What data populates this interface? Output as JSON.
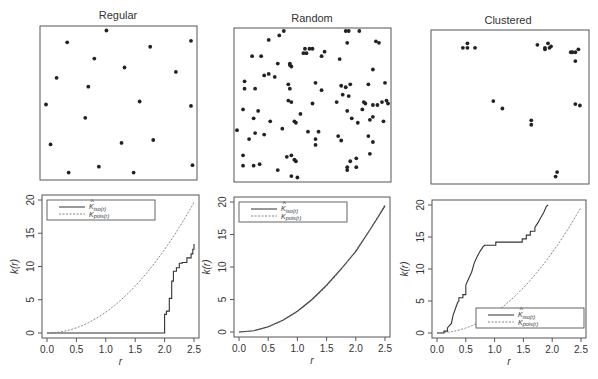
{
  "chart_data": [
    {
      "type": "scatter",
      "title": "Regular",
      "xlim": [
        0,
        1
      ],
      "ylim": [
        0,
        1
      ],
      "points": [
        [
          0.42,
          0.99
        ],
        [
          0.16,
          0.91
        ],
        [
          0.71,
          0.88
        ],
        [
          0.98,
          0.92
        ],
        [
          0.34,
          0.8
        ],
        [
          0.54,
          0.74
        ],
        [
          0.88,
          0.71
        ],
        [
          0.09,
          0.67
        ],
        [
          0.3,
          0.61
        ],
        [
          0.02,
          0.49
        ],
        [
          0.64,
          0.51
        ],
        [
          0.98,
          0.48
        ],
        [
          0.28,
          0.4
        ],
        [
          0.05,
          0.22
        ],
        [
          0.52,
          0.23
        ],
        [
          0.73,
          0.25
        ],
        [
          0.37,
          0.07
        ],
        [
          0.99,
          0.08
        ],
        [
          0.17,
          0.03
        ],
        [
          0.6,
          0.03
        ]
      ]
    },
    {
      "type": "scatter",
      "title": "Random",
      "xlim": [
        0,
        1
      ],
      "ylim": [
        0,
        1
      ],
      "points": [
        [
          0.21,
          0.94
        ],
        [
          0.28,
          0.97
        ],
        [
          0.31,
          1.0
        ],
        [
          0.45,
          0.88
        ],
        [
          0.48,
          0.88
        ],
        [
          0.5,
          0.88
        ],
        [
          0.46,
          0.85
        ],
        [
          0.44,
          0.85
        ],
        [
          0.58,
          0.86
        ],
        [
          0.72,
          1.0
        ],
        [
          0.74,
          1.0
        ],
        [
          0.81,
          1.0
        ],
        [
          0.73,
          0.92
        ],
        [
          0.92,
          0.93
        ],
        [
          0.94,
          0.92
        ],
        [
          0.1,
          0.83
        ],
        [
          0.16,
          0.83
        ],
        [
          0.56,
          0.83
        ],
        [
          0.68,
          0.81
        ],
        [
          0.35,
          0.78
        ],
        [
          0.35,
          0.77
        ],
        [
          0.36,
          0.76
        ],
        [
          0.27,
          0.78
        ],
        [
          0.9,
          0.74
        ],
        [
          0.18,
          0.7
        ],
        [
          0.21,
          0.71
        ],
        [
          0.25,
          0.69
        ],
        [
          0.05,
          0.66
        ],
        [
          0.34,
          0.64
        ],
        [
          0.52,
          0.65
        ],
        [
          0.75,
          0.64
        ],
        [
          0.05,
          0.61
        ],
        [
          0.12,
          0.61
        ],
        [
          0.35,
          0.61
        ],
        [
          0.56,
          0.6
        ],
        [
          0.69,
          0.63
        ],
        [
          0.72,
          0.62
        ],
        [
          0.87,
          0.64
        ],
        [
          0.98,
          0.65
        ],
        [
          0.34,
          0.53
        ],
        [
          0.36,
          0.52
        ],
        [
          0.7,
          0.57
        ],
        [
          0.74,
          0.56
        ],
        [
          0.9,
          0.5
        ],
        [
          0.93,
          0.5
        ],
        [
          0.96,
          0.52
        ],
        [
          0.99,
          0.53
        ],
        [
          1.0,
          0.51
        ],
        [
          0.5,
          0.51
        ],
        [
          0.66,
          0.52
        ],
        [
          0.84,
          0.52
        ],
        [
          0.85,
          0.51
        ],
        [
          0.04,
          0.47
        ],
        [
          0.14,
          0.46
        ],
        [
          0.42,
          0.44
        ],
        [
          0.73,
          0.46
        ],
        [
          0.83,
          0.47
        ],
        [
          0.11,
          0.41
        ],
        [
          0.22,
          0.39
        ],
        [
          0.38,
          0.39
        ],
        [
          0.39,
          0.38
        ],
        [
          0.76,
          0.41
        ],
        [
          0.88,
          0.4
        ],
        [
          0.9,
          0.42
        ],
        [
          0.97,
          0.39
        ],
        [
          0.8,
          0.38
        ],
        [
          0.0,
          0.33
        ],
        [
          0.3,
          0.34
        ],
        [
          0.47,
          0.32
        ],
        [
          0.54,
          0.32
        ],
        [
          0.12,
          0.31
        ],
        [
          0.18,
          0.3
        ],
        [
          0.67,
          0.29
        ],
        [
          0.69,
          0.26
        ],
        [
          0.87,
          0.29
        ],
        [
          0.08,
          0.27
        ],
        [
          0.52,
          0.27
        ],
        [
          0.52,
          0.23
        ],
        [
          0.9,
          0.25
        ],
        [
          0.04,
          0.16
        ],
        [
          0.33,
          0.15
        ],
        [
          0.36,
          0.16
        ],
        [
          0.38,
          0.13
        ],
        [
          0.39,
          0.12
        ],
        [
          0.75,
          0.12
        ],
        [
          0.79,
          0.14
        ],
        [
          0.88,
          0.17
        ],
        [
          0.04,
          0.09
        ],
        [
          0.11,
          0.09
        ],
        [
          0.15,
          0.1
        ],
        [
          0.27,
          0.06
        ],
        [
          0.36,
          0.02
        ],
        [
          0.4,
          0.01
        ],
        [
          0.73,
          0.08
        ],
        [
          0.73,
          0.06
        ],
        [
          0.79,
          0.08
        ]
      ]
    },
    {
      "type": "scatter",
      "title": "Clustered",
      "xlim": [
        0,
        1
      ],
      "ylim": [
        0,
        1
      ],
      "points": [
        [
          0.19,
          0.9
        ],
        [
          0.22,
          0.9
        ],
        [
          0.22,
          0.93
        ],
        [
          0.27,
          0.9
        ],
        [
          0.68,
          0.92
        ],
        [
          0.73,
          0.9
        ],
        [
          0.73,
          0.89
        ],
        [
          0.76,
          0.9
        ],
        [
          0.75,
          0.93
        ],
        [
          0.77,
          0.91
        ],
        [
          0.9,
          0.87
        ],
        [
          0.91,
          0.87
        ],
        [
          0.93,
          0.87
        ],
        [
          0.95,
          0.89
        ],
        [
          0.93,
          0.81
        ],
        [
          0.39,
          0.54
        ],
        [
          0.45,
          0.49
        ],
        [
          0.64,
          0.41
        ],
        [
          0.64,
          0.38
        ],
        [
          0.93,
          0.52
        ],
        [
          0.96,
          0.51
        ],
        [
          0.81,
          0.06
        ],
        [
          0.8,
          0.03
        ]
      ]
    },
    {
      "type": "line",
      "title": "",
      "xlabel": "r",
      "ylabel": "k(r)",
      "xlim": [
        0,
        2.5
      ],
      "ylim": [
        0,
        20
      ],
      "xticks": [
        "0.0",
        "0.5",
        "1.0",
        "1.5",
        "2.0",
        "2.5"
      ],
      "yticks": [
        "0",
        "5",
        "10",
        "15",
        "20"
      ],
      "legend": {
        "position": "top-left",
        "entries": [
          "K̂_iso(r)",
          "K_pois(r)"
        ]
      },
      "series": [
        {
          "name": "K̂_iso(r)",
          "style": "solid-step",
          "x": [
            0,
            2.0,
            2.0,
            2.03,
            2.03,
            2.08,
            2.08,
            2.12,
            2.12,
            2.15,
            2.15,
            2.2,
            2.2,
            2.25,
            2.25,
            2.3,
            2.3,
            2.38,
            2.38,
            2.45,
            2.45,
            2.48,
            2.48,
            2.5,
            2.5
          ],
          "y": [
            0,
            0,
            2.8,
            2.8,
            3.3,
            3.3,
            5.2,
            5.2,
            7.8,
            7.8,
            9.3,
            9.3,
            9.8,
            9.8,
            10.5,
            10.5,
            10.6,
            10.6,
            11.3,
            11.3,
            11.9,
            11.9,
            12.6,
            12.6,
            13.4
          ]
        },
        {
          "name": "K_pois(r)",
          "style": "dashed",
          "formula": "pi*r^2"
        }
      ]
    },
    {
      "type": "line",
      "title": "",
      "xlabel": "r",
      "ylabel": "k(r)",
      "xlim": [
        0,
        2.5
      ],
      "ylim": [
        0,
        20
      ],
      "xticks": [
        "0.0",
        "0.5",
        "1.0",
        "1.5",
        "2.0",
        "2.5"
      ],
      "yticks": [
        "0",
        "5",
        "10",
        "15",
        "20"
      ],
      "legend": {
        "position": "top-left",
        "entries": [
          "K̂_iso(r)",
          "K_pois(r)"
        ]
      },
      "series": [
        {
          "name": "K̂_iso(r)",
          "style": "solid",
          "x": [
            0,
            0.25,
            0.5,
            0.75,
            1.0,
            1.25,
            1.5,
            1.75,
            2.0,
            2.25,
            2.5
          ],
          "y": [
            0,
            0.2,
            0.8,
            1.8,
            3.2,
            5.0,
            7.2,
            9.7,
            12.4,
            15.8,
            19.4
          ]
        },
        {
          "name": "K_pois(r)",
          "style": "dashed",
          "formula": "pi*r^2"
        }
      ]
    },
    {
      "type": "line",
      "title": "",
      "xlabel": "r",
      "ylabel": "k(r)",
      "xlim": [
        0,
        2.5
      ],
      "ylim": [
        0,
        20
      ],
      "xticks": [
        "0.0",
        "0.5",
        "1.0",
        "1.5",
        "2.0",
        "2.5"
      ],
      "yticks": [
        "0",
        "5",
        "10",
        "15",
        "20"
      ],
      "legend": {
        "position": "bottom-right",
        "entries": [
          "K̂_iso(r)",
          "K_pois(r)"
        ]
      },
      "series": [
        {
          "name": "K̂_iso(r)",
          "style": "solid-step",
          "x": [
            0,
            0.12,
            0.12,
            0.18,
            0.18,
            0.25,
            0.28,
            0.32,
            0.36,
            0.38,
            0.38,
            0.45,
            0.45,
            0.5,
            0.5,
            0.55,
            0.6,
            0.65,
            0.7,
            0.75,
            0.8,
            0.82,
            0.82,
            1.02,
            1.02,
            1.48,
            1.48,
            1.55,
            1.55,
            1.62,
            1.62,
            1.7,
            1.7,
            1.75,
            1.8,
            1.85,
            1.9,
            1.93
          ],
          "y": [
            0,
            0,
            0.3,
            0.3,
            0.8,
            1.5,
            2.8,
            3.8,
            4.8,
            5.0,
            5.5,
            5.5,
            6.0,
            6.0,
            7.5,
            8.5,
            9.5,
            11.0,
            12.0,
            12.8,
            13.5,
            13.6,
            13.7,
            13.7,
            14.2,
            14.2,
            14.7,
            14.7,
            15.3,
            15.3,
            15.9,
            15.9,
            16.5,
            17.2,
            18.0,
            18.8,
            19.8,
            20
          ]
        },
        {
          "name": "K_pois(r)",
          "style": "dashed",
          "formula": "pi*r^2"
        }
      ]
    }
  ],
  "panels": {
    "titles": [
      "Regular",
      "Random",
      "Clustered"
    ],
    "xlabel": "r",
    "ylabel": "k(r)",
    "legend_iso": "K̂iso(r)",
    "legend_pois": "Kpois(r)",
    "legend_iso_main": "K",
    "legend_iso_sub": "iso(r)",
    "legend_pois_main": "K",
    "legend_pois_sub": "pois(r)",
    "xticks": [
      "0.0",
      "0.5",
      "1.0",
      "1.5",
      "2.0",
      "2.5"
    ],
    "yticks": [
      "0",
      "5",
      "10",
      "15",
      "20"
    ]
  },
  "colors": {
    "points": "#222222",
    "frame": "#555555",
    "solid": "#333333",
    "dashed": "#777777"
  }
}
